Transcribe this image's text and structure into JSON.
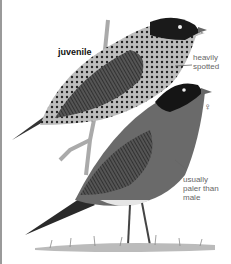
{
  "illustration": {
    "subject": "American Robin",
    "figures": [
      {
        "id": "juvenile",
        "label": "juvenile"
      },
      {
        "id": "female",
        "label": "♀"
      }
    ],
    "annotations": [
      {
        "target": "juvenile-breast",
        "text_line1": "heavily",
        "text_line2": "spotted"
      },
      {
        "target": "female-breast",
        "text_line1": "usually",
        "text_line2": "paler than",
        "text_line3": "male"
      }
    ]
  }
}
